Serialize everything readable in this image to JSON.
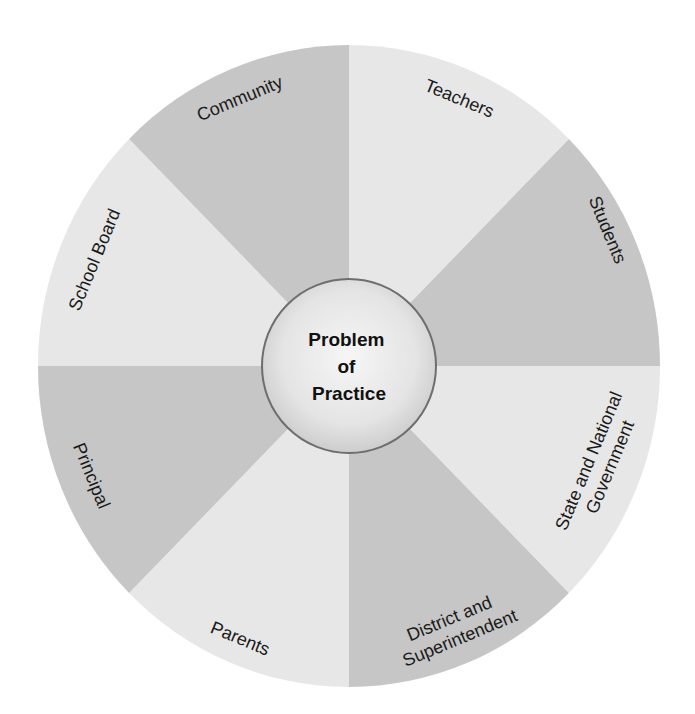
{
  "diagram": {
    "center": {
      "lines": [
        "Problem",
        "of",
        "Practice"
      ]
    },
    "colors": {
      "light_slice": "#e7e7e7",
      "dark_slice": "#c6c6c6",
      "center_fill_inner": "#f4f4f4",
      "center_fill_outer": "#cfcfcf",
      "center_border": "#6e6e6e",
      "text": "#1a1a1a"
    },
    "slices": [
      {
        "id": "teachers",
        "lines": [
          "Teachers"
        ],
        "shade": "light"
      },
      {
        "id": "students",
        "lines": [
          "Students"
        ],
        "shade": "dark"
      },
      {
        "id": "state-national-government",
        "lines": [
          "State and National",
          "Government"
        ],
        "shade": "light"
      },
      {
        "id": "district-superintendent",
        "lines": [
          "District and",
          "Superintendent"
        ],
        "shade": "dark"
      },
      {
        "id": "parents",
        "lines": [
          "Parents"
        ],
        "shade": "light"
      },
      {
        "id": "principal",
        "lines": [
          "Principal"
        ],
        "shade": "dark"
      },
      {
        "id": "school-board",
        "lines": [
          "School Board"
        ],
        "shade": "light"
      },
      {
        "id": "community",
        "lines": [
          "Community"
        ],
        "shade": "dark"
      }
    ]
  }
}
